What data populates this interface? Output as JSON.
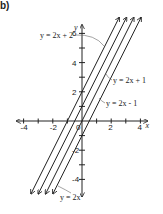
{
  "part_label": "b)",
  "chart_data": {
    "type": "line",
    "title": "",
    "xlabel": "x",
    "ylabel": "y",
    "xlim": [
      -4.5,
      4.5
    ],
    "ylim": [
      -5.2,
      6.6
    ],
    "x_ticks": [
      -4,
      -3,
      -2,
      -1,
      0,
      1,
      2,
      3,
      4
    ],
    "x_tick_labels": [
      "-4",
      "-2",
      "0",
      "2",
      "4"
    ],
    "y_ticks": [
      -4,
      -3,
      -2,
      -1,
      1,
      2,
      3,
      4,
      5,
      6
    ],
    "y_tick_labels": [
      "-4",
      "-2",
      "2",
      "4",
      "6"
    ],
    "grid": false,
    "series": [
      {
        "name": "y = 2x + 2",
        "slope": 2,
        "intercept": 2
      },
      {
        "name": "y = 2x + 1",
        "slope": 2,
        "intercept": 1
      },
      {
        "name": "y = 2x",
        "slope": 2,
        "intercept": 0
      },
      {
        "name": "y = 2x - 1",
        "slope": 2,
        "intercept": -1
      }
    ],
    "annotations": [
      "y = 2x + 2",
      "y = 2x + 1",
      "y = 2x - 1",
      "y = 2x"
    ]
  }
}
